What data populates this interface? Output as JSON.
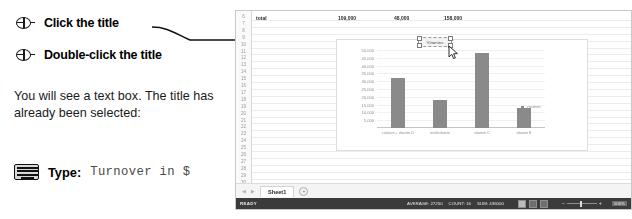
{
  "instructions": {
    "steps": [
      {
        "icon": "mouse-icon",
        "label": "Click the title"
      },
      {
        "icon": "mouse-icon",
        "label": "Double-click the title"
      }
    ],
    "body": "You will see a text box. The title has already been selected:",
    "type_icon": "keyboard-icon",
    "type_word": "Type:",
    "type_value": "Turnover in $"
  },
  "excel": {
    "row_numbers": [
      "6",
      "7",
      "8",
      "9",
      "10",
      "11",
      "12",
      "13",
      "14",
      "15",
      "16",
      "17",
      "18",
      "19",
      "20",
      "21",
      "22",
      "23",
      "24",
      "25",
      "26",
      "27",
      "28",
      "29",
      "30"
    ],
    "data_row": {
      "label": "total",
      "values": [
        "109,000",
        "48,000",
        "158,000"
      ]
    },
    "chart_title_box": {
      "text": "Vitamins",
      "selected": true
    },
    "sheet_tab": "Sheet1",
    "add_sheet": "+",
    "nav_prev": "◀",
    "nav_next": "▶",
    "status": {
      "ready": "READY",
      "average": "AVERAGE: 27250",
      "count": "COUNT: 16",
      "sum": "SUM: 436000",
      "zoom": "100%",
      "zoom_minus": "−",
      "zoom_plus": "+"
    }
  },
  "chart_data": {
    "type": "bar",
    "title": "Vitamins",
    "categories": [
      "calcium + vitamin D",
      "multivitamin",
      "vitamin C",
      "vitamin E"
    ],
    "values": [
      32000,
      18000,
      48000,
      13000
    ],
    "series": [
      {
        "name": "Vitamins",
        "values": [
          32000,
          18000,
          48000,
          13000
        ]
      }
    ],
    "xlabel": "",
    "ylabel": "",
    "ylim": [
      0,
      50000
    ],
    "yticks": [
      "50,000",
      "45,000",
      "40,000",
      "35,000",
      "30,000",
      "25,000",
      "20,000",
      "15,000",
      "10,000",
      "5,000"
    ],
    "ytick_values": [
      50000,
      45000,
      40000,
      35000,
      30000,
      25000,
      20000,
      15000,
      10000,
      5000
    ],
    "grid": true,
    "legend": "Vitamins",
    "legend_position": "right",
    "bar_color": "#8a8a8a"
  }
}
